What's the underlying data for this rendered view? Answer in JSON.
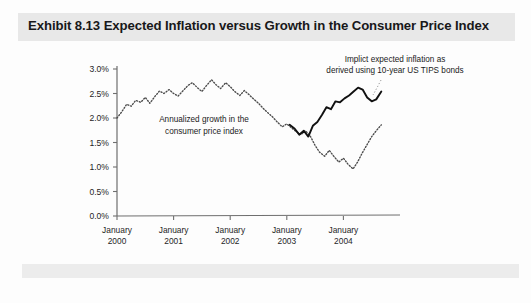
{
  "figure": {
    "title": "Exhibit 8.13 Expected Inflation versus Growth in the Consumer Price Index",
    "title_band_color": "#e8e8e8",
    "background_color": "#fdfdfd"
  },
  "annotations": {
    "tips_line1": "Implict expected inflation as",
    "tips_line2": "derived using 10-year US TIPS bonds",
    "cpi_line1": "Annualized growth in the",
    "cpi_line2": "consumer price index"
  },
  "chart_data": {
    "type": "line",
    "title": "Exhibit 8.13 Expected Inflation versus Growth in the Consumer Price Index",
    "xlabel": "",
    "ylabel": "",
    "ylim": [
      0.0,
      3.0
    ],
    "ytick_values": [
      0.0,
      0.5,
      1.0,
      1.5,
      2.0,
      2.5,
      3.0
    ],
    "ytick_labels": [
      "0.0%",
      "0.5%",
      "1.0%",
      "1.5%",
      "2.0%",
      "2.5%",
      "3.0%"
    ],
    "xtick_labels": [
      [
        "January",
        "2000"
      ],
      [
        "January",
        "2001"
      ],
      [
        "January",
        "2002"
      ],
      [
        "January",
        "2003"
      ],
      [
        "January",
        "2004"
      ]
    ],
    "xlim": [
      2000.0,
      2005.0
    ],
    "grid": false,
    "legend_position": "annotations-inline",
    "series": [
      {
        "name": "Annualized growth in the consumer price index",
        "style": "dotted",
        "color": "#4a4a4a",
        "x": [
          2000.0,
          2000.08,
          2000.17,
          2000.25,
          2000.33,
          2000.42,
          2000.5,
          2000.58,
          2000.67,
          2000.75,
          2000.83,
          2000.92,
          2001.0,
          2001.08,
          2001.17,
          2001.25,
          2001.33,
          2001.42,
          2001.5,
          2001.58,
          2001.67,
          2001.75,
          2001.83,
          2001.92,
          2002.0,
          2002.08,
          2002.17,
          2002.25,
          2002.33,
          2002.42,
          2002.5,
          2002.58,
          2002.67,
          2002.75,
          2002.83,
          2002.92,
          2003.0,
          2003.08,
          2003.17,
          2003.25,
          2003.33,
          2003.42,
          2003.5,
          2003.58,
          2003.67,
          2003.75,
          2003.83,
          2003.92,
          2004.0,
          2004.08,
          2004.17,
          2004.25,
          2004.33,
          2004.42,
          2004.5,
          2004.58,
          2004.67
        ],
        "y": [
          2.0,
          2.12,
          2.28,
          2.24,
          2.36,
          2.32,
          2.42,
          2.3,
          2.44,
          2.55,
          2.5,
          2.58,
          2.5,
          2.45,
          2.56,
          2.66,
          2.72,
          2.62,
          2.54,
          2.66,
          2.78,
          2.68,
          2.6,
          2.72,
          2.64,
          2.54,
          2.46,
          2.56,
          2.48,
          2.38,
          2.3,
          2.2,
          2.1,
          2.02,
          1.92,
          1.82,
          1.88,
          1.8,
          1.72,
          1.66,
          1.74,
          1.62,
          1.44,
          1.3,
          1.22,
          1.34,
          1.22,
          1.1,
          1.18,
          1.06,
          0.96,
          1.1,
          1.28,
          1.46,
          1.62,
          1.74,
          1.86
        ],
        "note": "dotted line, starts January 2000 at 2.0%, peaks near 2.8% in 2001, troughs near 1.0% in early 2004, ends rising near 1.9%"
      },
      {
        "name": "Implict expected inflation as derived using 10-year US TIPS bonds",
        "style": "solid",
        "color": "#111111",
        "x": [
          2003.05,
          2003.14,
          2003.22,
          2003.3,
          2003.38,
          2003.46,
          2003.54,
          2003.62,
          2003.7,
          2003.78,
          2003.86,
          2003.94,
          2004.02,
          2004.1,
          2004.18,
          2004.26,
          2004.34,
          2004.42,
          2004.5,
          2004.58,
          2004.67
        ],
        "y": [
          1.86,
          1.78,
          1.66,
          1.74,
          1.62,
          1.84,
          1.92,
          2.06,
          2.22,
          2.18,
          2.34,
          2.32,
          2.4,
          2.46,
          2.54,
          2.62,
          2.58,
          2.42,
          2.34,
          2.38,
          2.54
        ],
        "note": "solid bold line, begins early 2003 near 1.85%, dips to 1.62%, rises to 2.6% peak in 2004, dips then recovers to ~2.55%"
      }
    ]
  }
}
